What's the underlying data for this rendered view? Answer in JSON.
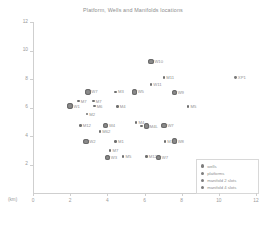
{
  "chart_data": {
    "type": "scatter",
    "title": "Platform, Wells and Manifolds locations",
    "xlabel": "(km)",
    "ylabel": "",
    "xlim": [
      0,
      12
    ],
    "ylim": [
      0,
      12
    ],
    "xticks": [
      "0",
      "2",
      "4",
      "6",
      "8",
      "10",
      "12"
    ],
    "yticks": [
      "2",
      "4",
      "6",
      "8",
      "10",
      "12"
    ],
    "grid": false,
    "legend_position": "lower-right",
    "legend": [
      {
        "label": "wells",
        "marker": "small-circle"
      },
      {
        "label": "platforms",
        "marker": "small-circle"
      },
      {
        "label": "manifold 2 slots",
        "marker": "small-circle"
      },
      {
        "label": "manifold 4 slots",
        "marker": "small-circle"
      }
    ],
    "series": [
      {
        "name": "wells",
        "kind": "well",
        "points": [
          {
            "label": "M7",
            "x": 2.45,
            "y": 6.45
          },
          {
            "label": "M7",
            "x": 3.25,
            "y": 6.45
          },
          {
            "label": "M3",
            "x": 4.45,
            "y": 7.1
          },
          {
            "label": "M6",
            "x": 3.3,
            "y": 6.1
          },
          {
            "label": "M2",
            "x": 2.9,
            "y": 5.55
          },
          {
            "label": "M4",
            "x": 4.55,
            "y": 6.05
          },
          {
            "label": "M11",
            "x": 7.05,
            "y": 8.1
          },
          {
            "label": "W11",
            "x": 6.35,
            "y": 7.6
          },
          {
            "label": "M5",
            "x": 8.35,
            "y": 6.05
          },
          {
            "label": "M12",
            "x": 2.55,
            "y": 4.75
          },
          {
            "label": "M4",
            "x": 5.55,
            "y": 4.95
          },
          {
            "label": "M8",
            "x": 5.85,
            "y": 4.7
          },
          {
            "label": "M62",
            "x": 3.6,
            "y": 4.3
          },
          {
            "label": "M1",
            "x": 4.45,
            "y": 3.6
          },
          {
            "label": "M3",
            "x": 7.1,
            "y": 3.6
          },
          {
            "label": "M7",
            "x": 4.15,
            "y": 3.0
          },
          {
            "label": "M5",
            "x": 4.85,
            "y": 2.55
          },
          {
            "label": "M12",
            "x": 6.1,
            "y": 2.55
          }
        ]
      },
      {
        "name": "platforms",
        "kind": "plat",
        "points": [
          {
            "label": "XP1",
            "x": 10.9,
            "y": 8.1
          }
        ]
      },
      {
        "name": "manifold 2 slots",
        "kind": "m2",
        "points": [
          {
            "label": "W7",
            "x": 2.95,
            "y": 7.1
          },
          {
            "label": "W5",
            "x": 5.45,
            "y": 7.1
          },
          {
            "label": "W1",
            "x": 2.0,
            "y": 6.1
          },
          {
            "label": "W10",
            "x": 6.35,
            "y": 9.25
          },
          {
            "label": "W9",
            "x": 7.6,
            "y": 7.05
          },
          {
            "label": "W4",
            "x": 3.9,
            "y": 4.75
          },
          {
            "label": "W7",
            "x": 7.05,
            "y": 4.75
          },
          {
            "label": "W2",
            "x": 2.85,
            "y": 3.6
          },
          {
            "label": "W8",
            "x": 7.6,
            "y": 3.65
          },
          {
            "label": "W7",
            "x": 6.75,
            "y": 2.5
          },
          {
            "label": "W3",
            "x": 4.0,
            "y": 2.5
          }
        ]
      },
      {
        "name": "manifold 4 slots",
        "kind": "m4",
        "points": [
          {
            "label": "M4L",
            "x": 6.1,
            "y": 4.7
          }
        ]
      }
    ]
  }
}
